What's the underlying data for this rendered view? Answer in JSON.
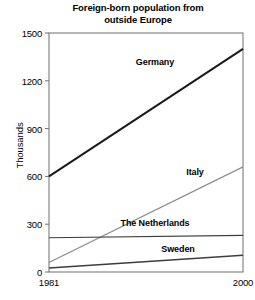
{
  "chart_data": {
    "type": "line",
    "title": "Foreign-born population from\noutside Europe",
    "xlabel": "",
    "ylabel": "Thousands",
    "x": [
      1981,
      2000
    ],
    "xtick_labels": [
      "1981",
      "2000"
    ],
    "xlim": [
      1981,
      2000
    ],
    "ytick_labels": [
      "0",
      "300",
      "600",
      "900",
      "1200",
      "1500"
    ],
    "yticks": [
      0,
      300,
      600,
      900,
      1200,
      1500
    ],
    "ylim": [
      0,
      1500
    ],
    "grid": false,
    "legend": "inline-labels",
    "series": [
      {
        "name": "Germany",
        "values": [
          600,
          1400
        ],
        "color": "#1a1a1a",
        "width": 2.0,
        "label_x": 155,
        "label_y": 57
      },
      {
        "name": "Italy",
        "values": [
          60,
          660
        ],
        "color": "#8c8c8c",
        "width": 1.2,
        "label_x": 195,
        "label_y": 167
      },
      {
        "name": "The Netherlands",
        "values": [
          215,
          230
        ],
        "color": "#3d3d3d",
        "width": 1.2,
        "label_x": 155,
        "label_y": 218
      },
      {
        "name": "Sweden",
        "values": [
          25,
          105
        ],
        "color": "#3d3d3d",
        "width": 1.4,
        "label_x": 178,
        "label_y": 244
      }
    ],
    "frame_color": "#6e6e6e",
    "axis_color": "#6e6e6e"
  },
  "yticks_text": {
    "t0": "0",
    "t1": "300",
    "t2": "600",
    "t3": "900",
    "t4": "1200",
    "t5": "1500"
  },
  "xticks_text": {
    "t0": "1981",
    "t1": "2000"
  },
  "labels": {
    "germany": "Germany",
    "italy": "Italy",
    "netherlands": "The Netherlands",
    "sweden": "Sweden",
    "yaxis": "Thousands"
  }
}
